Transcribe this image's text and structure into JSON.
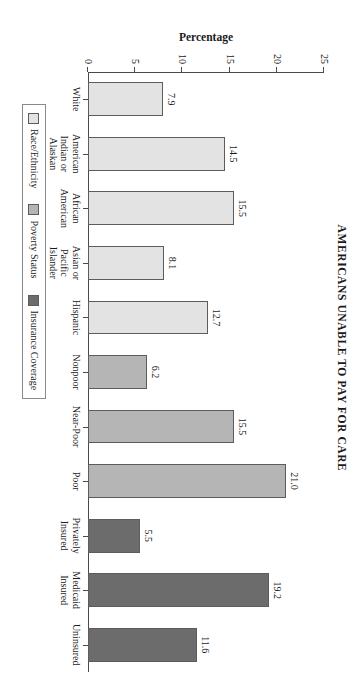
{
  "chart_data": {
    "type": "bar",
    "title": "AMERICANS UNABLE TO PAY FOR CARE",
    "xlabel": "",
    "ylabel": "Percentage",
    "ylim": [
      0,
      25
    ],
    "yticks": [
      0,
      5,
      10,
      15,
      20,
      25
    ],
    "grid": false,
    "legend_position": "bottom-center",
    "categories": [
      "White",
      "American Indian or Alaskan Native",
      "African American",
      "Asian or Pacific Islander",
      "Hispanic",
      "Nonpoor",
      "Near-Poor",
      "Poor",
      "Privately Insured",
      "Medicaid Insured",
      "Uninsured"
    ],
    "category_lines": [
      [
        "White"
      ],
      [
        "American",
        "Indian or",
        "Alaskan",
        "Native"
      ],
      [
        "African",
        "American"
      ],
      [
        "Asian or",
        "Pacific",
        "Islander"
      ],
      [
        "Hispanic"
      ],
      [
        "Nonpoor"
      ],
      [
        "Near-Poor"
      ],
      [
        "Poor"
      ],
      [
        "Privately",
        "Insured"
      ],
      [
        "Medicaid",
        "Insured"
      ],
      [
        "Uninsured"
      ]
    ],
    "values": [
      7.9,
      14.5,
      15.5,
      8.1,
      12.7,
      6.2,
      15.5,
      21.0,
      5.5,
      19.2,
      11.6
    ],
    "value_labels": [
      "7.9",
      "14.5",
      "15.5",
      "8.1",
      "12.7",
      "6.2",
      "15.5",
      "21.0",
      "5.5",
      "19.2",
      "11.6"
    ],
    "groups": [
      "Race/Ethnicity",
      "Race/Ethnicity",
      "Race/Ethnicity",
      "Race/Ethnicity",
      "Race/Ethnicity",
      "Poverty Status",
      "Poverty Status",
      "Poverty Status",
      "Insurance Coverage",
      "Insurance Coverage",
      "Insurance Coverage"
    ],
    "legend": [
      {
        "label": "Race/Ethnicity",
        "color": "#e3e3e3"
      },
      {
        "label": "Poverty Status",
        "color": "#b5b5b5"
      },
      {
        "label": "Insurance Coverage",
        "color": "#6c6c6c"
      }
    ]
  }
}
